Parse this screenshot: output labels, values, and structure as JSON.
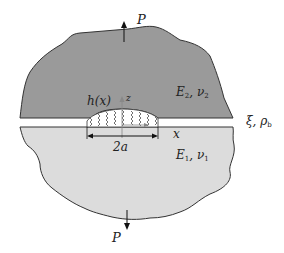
{
  "figure": {
    "upper_body": {
      "load": "P",
      "elastic_modulus": "E",
      "modulus_sub": "2",
      "poisson": "ν",
      "poisson_sub": "2",
      "fill": "#9a9a9a"
    },
    "lower_body": {
      "load": "P",
      "elastic_modulus": "E",
      "modulus_sub": "1",
      "poisson": "ν",
      "poisson_sub": "1",
      "fill": "#dcdcdc"
    },
    "interface": {
      "gap_function": "h(x)",
      "z_axis": "z",
      "x_axis": "x",
      "contact_width": "2a",
      "bond_params": "ξ, ρ",
      "bond_sub": "b"
    },
    "colors": {
      "outline": "#333333",
      "axis": "#888888",
      "arrow": "#111111"
    }
  }
}
